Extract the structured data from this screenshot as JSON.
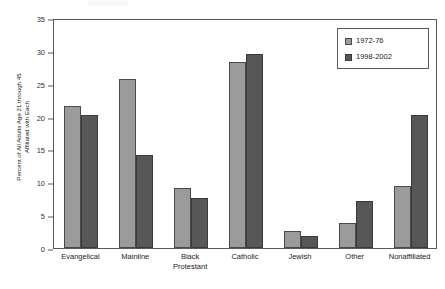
{
  "chart_data": {
    "type": "bar",
    "title": "",
    "xlabel": "",
    "ylabel": "Percent of All Adults Age 21 through 45 Affiliated with Each",
    "ylabel_lines": [
      "Percent of All Adults Age 21 through 45",
      "Affiliated with Each"
    ],
    "categories": [
      "Evangelical",
      "Mainline",
      "Black Protestant",
      "Catholic",
      "Jewish",
      "Other",
      "Nonaffiliated"
    ],
    "category_lines": [
      [
        "Evangelical"
      ],
      [
        "Mainline"
      ],
      [
        "Black",
        "Protestant"
      ],
      [
        "Catholic"
      ],
      [
        "Jewish"
      ],
      [
        "Other"
      ],
      [
        "Nonaffiliated"
      ]
    ],
    "series": [
      {
        "name": "1972-76",
        "color": "#9b9b9b",
        "values": [
          21.6,
          25.7,
          9.2,
          28.3,
          2.6,
          3.8,
          9.5
        ]
      },
      {
        "name": "1998-2002",
        "color": "#575757",
        "values": [
          20.3,
          14.2,
          7.6,
          29.5,
          1.9,
          7.2,
          20.2
        ]
      }
    ],
    "ylim": [
      0,
      35
    ],
    "yticks": [
      0,
      5,
      10,
      15,
      20,
      25,
      30,
      35
    ],
    "ytick_labels": [
      "0",
      "5",
      "10",
      "15",
      "20",
      "25",
      "30",
      "35"
    ],
    "grid": false,
    "legend_position": "top-right"
  },
  "legend": {
    "entries": [
      {
        "label": "1972-76"
      },
      {
        "label": "1998-2002"
      }
    ]
  },
  "colors": {
    "series_1972_76": "#9b9b9b",
    "series_1998_2002": "#575757",
    "axis": "#5a5a5a",
    "background": "#ffffff"
  }
}
